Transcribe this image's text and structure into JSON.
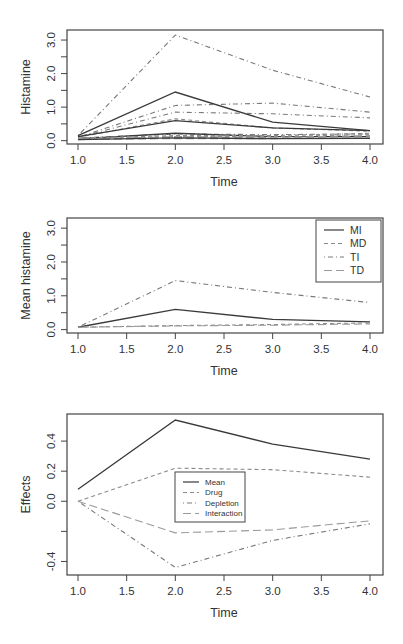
{
  "chart_data": [
    {
      "id": "top",
      "type": "line",
      "title": "",
      "xlabel": "Time",
      "ylabel": "Histamine",
      "x": [
        1,
        2,
        3,
        4
      ],
      "xticks": [
        "1.0",
        "1.5",
        "2.0",
        "2.5",
        "3.0",
        "3.5",
        "4.0"
      ],
      "xtick_values": [
        1.0,
        1.5,
        2.0,
        2.5,
        3.0,
        3.5,
        4.0
      ],
      "yticks": [
        "0.0",
        "1.0",
        "2.0",
        "3.0"
      ],
      "ytick_values": [
        0.0,
        0.5,
        1.0,
        1.5,
        2.0,
        2.5,
        3.0
      ],
      "ytick_labeled": [
        0.0,
        1.0,
        2.0,
        3.0
      ],
      "xlim": [
        0.9,
        4.1
      ],
      "ylim": [
        -0.1,
        3.3
      ],
      "grid": false,
      "legend": null,
      "series": [
        {
          "name": "TI subject 1",
          "group": "TI",
          "style": "dashdot",
          "values": [
            0.15,
            3.15,
            2.1,
            1.3
          ]
        },
        {
          "name": "MI subject 1",
          "group": "MI",
          "style": "solid",
          "values": [
            0.15,
            1.45,
            0.55,
            0.3
          ]
        },
        {
          "name": "TI subject 2",
          "group": "TI",
          "style": "dashdot",
          "values": [
            0.1,
            1.05,
            1.12,
            0.85
          ]
        },
        {
          "name": "TI subject 3",
          "group": "TI",
          "style": "dashdot",
          "values": [
            0.1,
            0.85,
            0.8,
            0.68
          ]
        },
        {
          "name": "MD subject 1",
          "group": "MD",
          "style": "dashed",
          "values": [
            0.1,
            0.65,
            0.38,
            0.28
          ]
        },
        {
          "name": "MI subject 2",
          "group": "MI",
          "style": "solid",
          "values": [
            0.12,
            0.6,
            0.38,
            0.3
          ]
        },
        {
          "name": "TI subject 4",
          "group": "TI",
          "style": "dashdot",
          "values": [
            0.08,
            0.2,
            0.18,
            0.2
          ]
        },
        {
          "name": "MI subject 3",
          "group": "MI",
          "style": "solid",
          "values": [
            0.05,
            0.22,
            0.12,
            0.12
          ]
        },
        {
          "name": "MD subject 2",
          "group": "MD",
          "style": "dashed",
          "values": [
            0.08,
            0.15,
            0.15,
            0.22
          ]
        },
        {
          "name": "MD subject 3",
          "group": "MD",
          "style": "dashed",
          "values": [
            0.06,
            0.12,
            0.12,
            0.18
          ]
        },
        {
          "name": "TD subject 1",
          "group": "TD",
          "style": "longdash",
          "values": [
            0.05,
            0.12,
            0.1,
            0.15
          ]
        },
        {
          "name": "TD subject 2",
          "group": "TD",
          "style": "longdash",
          "values": [
            0.04,
            0.1,
            0.08,
            0.12
          ]
        },
        {
          "name": "TD subject 3",
          "group": "TD",
          "style": "longdash",
          "values": [
            0.03,
            0.06,
            0.06,
            0.08
          ]
        },
        {
          "name": "MI subject 4",
          "group": "MI",
          "style": "solid",
          "values": [
            0.03,
            0.08,
            0.06,
            0.07
          ]
        }
      ]
    },
    {
      "id": "mid",
      "type": "line",
      "title": "",
      "xlabel": "Time",
      "ylabel": "Mean histamine",
      "x": [
        1,
        2,
        3,
        4
      ],
      "xticks": [
        "1.0",
        "1.5",
        "2.0",
        "2.5",
        "3.0",
        "3.5",
        "4.0"
      ],
      "xtick_values": [
        1.0,
        1.5,
        2.0,
        2.5,
        3.0,
        3.5,
        4.0
      ],
      "yticks": [
        "0.0",
        "1.0",
        "2.0",
        "3.0"
      ],
      "ytick_values": [
        0.0,
        0.5,
        1.0,
        1.5,
        2.0,
        2.5,
        3.0
      ],
      "ytick_labeled": [
        0.0,
        1.0,
        2.0,
        3.0
      ],
      "xlim": [
        0.9,
        4.1
      ],
      "ylim": [
        -0.1,
        3.3
      ],
      "grid": false,
      "legend": {
        "position": "topright",
        "entries": [
          "MI",
          "MD",
          "TI",
          "TD"
        ]
      },
      "series": [
        {
          "name": "MI",
          "style": "solid",
          "values": [
            0.07,
            0.6,
            0.3,
            0.23
          ]
        },
        {
          "name": "MD",
          "style": "dashed",
          "values": [
            0.07,
            0.12,
            0.15,
            0.2
          ]
        },
        {
          "name": "TI",
          "style": "dashdot",
          "values": [
            0.07,
            1.45,
            1.1,
            0.8
          ]
        },
        {
          "name": "TD",
          "style": "longdash",
          "values": [
            0.07,
            0.11,
            0.13,
            0.17
          ]
        }
      ]
    },
    {
      "id": "bot",
      "type": "line",
      "title": "",
      "xlabel": "Time",
      "ylabel": "Effects",
      "x": [
        1,
        2,
        3,
        4
      ],
      "xticks": [
        "1.0",
        "1.5",
        "2.0",
        "2.5",
        "3.0",
        "3.5",
        "4.0"
      ],
      "xtick_values": [
        1.0,
        1.5,
        2.0,
        2.5,
        3.0,
        3.5,
        4.0
      ],
      "yticks": [
        "-0.4",
        "0.0",
        "0.2",
        "0.4"
      ],
      "ytick_values": [
        -0.4,
        -0.2,
        0.0,
        0.2,
        0.4
      ],
      "ytick_labeled": [
        -0.4,
        0.0,
        0.2,
        0.4
      ],
      "xlim": [
        0.9,
        4.1
      ],
      "ylim": [
        -0.49,
        0.58
      ],
      "grid": false,
      "legend": {
        "position": "center",
        "entries": [
          "Mean",
          "Drug",
          "Depletion",
          "Interaction"
        ]
      },
      "series": [
        {
          "name": "Mean",
          "style": "solid",
          "values": [
            0.08,
            0.54,
            0.38,
            0.28
          ]
        },
        {
          "name": "Drug",
          "style": "dashed",
          "values": [
            0.0,
            0.22,
            0.21,
            0.16
          ]
        },
        {
          "name": "Depletion",
          "style": "dashdot",
          "values": [
            0.0,
            -0.44,
            -0.26,
            -0.15
          ]
        },
        {
          "name": "Interaction",
          "style": "longdash",
          "values": [
            0.0,
            -0.21,
            -0.19,
            -0.13
          ]
        }
      ]
    }
  ],
  "colors": {
    "solid": "#3a3a3a",
    "dashed": "#8a8a8a",
    "dashdot": "#7a7a7a",
    "longdash": "#9a9a9a",
    "axis": "#444444",
    "text": "#333333"
  },
  "layout": {
    "top": {
      "box": [
        67,
        30,
        383,
        144
      ]
    },
    "mid": {
      "box": [
        67,
        18,
        383,
        133
      ]
    },
    "bot": {
      "box": [
        67,
        14,
        383,
        175
      ]
    }
  }
}
